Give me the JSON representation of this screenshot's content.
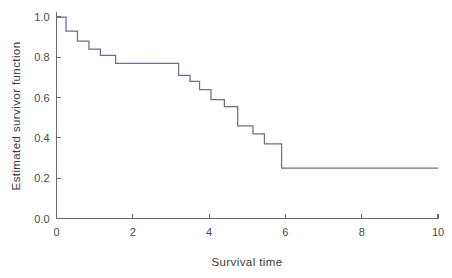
{
  "chart_data": {
    "type": "line",
    "title": "",
    "xlabel": "Survival time",
    "ylabel": "Estimated survivor function",
    "xlim": [
      0,
      10
    ],
    "ylim": [
      0.0,
      1.0
    ],
    "xticks": [
      0,
      2,
      4,
      6,
      8,
      10
    ],
    "xtick_labels": [
      "0",
      "2",
      "4",
      "6",
      "8",
      "10"
    ],
    "yticks": [
      0.0,
      0.2,
      0.4,
      0.6,
      0.8,
      1.0
    ],
    "ytick_labels": [
      "0.0",
      "0.2",
      "0.4",
      "0.6",
      "0.8",
      "1.0"
    ],
    "grid": false,
    "legend": "none",
    "step_type": "post",
    "series": [
      {
        "name": "Estimated survivor function",
        "color": "#6e6e86",
        "x": [
          0.0,
          0.25,
          0.55,
          0.85,
          1.15,
          1.55,
          1.9,
          3.2,
          3.5,
          3.75,
          4.05,
          4.4,
          4.75,
          5.15,
          5.45,
          5.9,
          10.0
        ],
        "y": [
          1.0,
          1.0,
          0.93,
          0.88,
          0.84,
          0.81,
          0.77,
          0.77,
          0.71,
          0.68,
          0.64,
          0.59,
          0.555,
          0.46,
          0.42,
          0.37,
          0.25
        ],
        "steps": [
          {
            "t": 0.0,
            "s": 1.0
          },
          {
            "t": 0.25,
            "s": 0.93
          },
          {
            "t": 0.55,
            "s": 0.88
          },
          {
            "t": 0.85,
            "s": 0.84
          },
          {
            "t": 1.15,
            "s": 0.81
          },
          {
            "t": 1.55,
            "s": 0.77
          },
          {
            "t": 3.2,
            "s": 0.71
          },
          {
            "t": 3.5,
            "s": 0.68
          },
          {
            "t": 3.75,
            "s": 0.64
          },
          {
            "t": 4.05,
            "s": 0.59
          },
          {
            "t": 4.4,
            "s": 0.555
          },
          {
            "t": 4.75,
            "s": 0.46
          },
          {
            "t": 5.15,
            "s": 0.42
          },
          {
            "t": 5.45,
            "s": 0.37
          },
          {
            "t": 5.9,
            "s": 0.25
          },
          {
            "t": 10.0,
            "s": 0.25
          }
        ]
      }
    ]
  }
}
